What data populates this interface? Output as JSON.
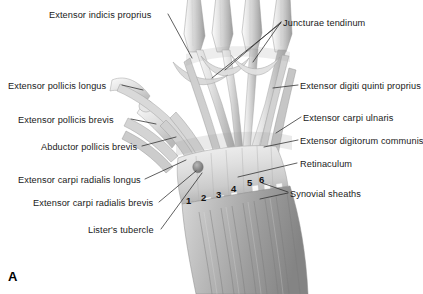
{
  "figure": {
    "panel_letter": "A",
    "background_color": "#ffffff",
    "label_color": "#1a1a1a",
    "leader_color": "#2b2b2b"
  },
  "labels": [
    {
      "id": "extensor-indicis-proprius",
      "text": "Extensor indicis proprius",
      "x": 49,
      "y": 11,
      "align": "left"
    },
    {
      "id": "juncturae-tendinum",
      "text": "Juncturae tendinum",
      "x": 283,
      "y": 19,
      "align": "left"
    },
    {
      "id": "extensor-pollicis-longus",
      "text": "Extensor pollicis longus",
      "x": 8,
      "y": 82,
      "align": "left"
    },
    {
      "id": "extensor-digiti-quinti-proprius",
      "text": "Extensor digiti quinti proprius",
      "x": 300,
      "y": 82,
      "align": "left"
    },
    {
      "id": "extensor-pollicis-brevis",
      "text": "Extensor pollicis brevis",
      "x": 18,
      "y": 116,
      "align": "left"
    },
    {
      "id": "extensor-carpi-ulnaris",
      "text": "Extensor carpi ulnaris",
      "x": 303,
      "y": 114,
      "align": "left"
    },
    {
      "id": "extensor-digitorum-communis",
      "text": "Extensor digitorum communis",
      "x": 300,
      "y": 137,
      "align": "left"
    },
    {
      "id": "abductor-pollicis-brevis",
      "text": "Abductor pollicis brevis",
      "x": 41,
      "y": 143,
      "align": "left"
    },
    {
      "id": "retinaculum",
      "text": "Retinaculum",
      "x": 300,
      "y": 160,
      "align": "left"
    },
    {
      "id": "extensor-carpi-radialis-longus",
      "text": "Extensor carpi radialis longus",
      "x": 18,
      "y": 176,
      "align": "left"
    },
    {
      "id": "extensor-carpi-radialis-brevis",
      "text": "Extensor carpi radialis brevis",
      "x": 33,
      "y": 199,
      "align": "left"
    },
    {
      "id": "synovial-sheaths",
      "text": "Synovial sheaths",
      "x": 290,
      "y": 190,
      "align": "left"
    },
    {
      "id": "listers-tubercle",
      "text": "Lister's tubercle",
      "x": 88,
      "y": 226,
      "align": "left"
    }
  ],
  "compartment_numbers": [
    {
      "id": "compartment-1",
      "text": "1",
      "x": 186,
      "y": 196
    },
    {
      "id": "compartment-2",
      "text": "2",
      "x": 201,
      "y": 193
    },
    {
      "id": "compartment-3",
      "text": "3",
      "x": 216,
      "y": 190
    },
    {
      "id": "compartment-4",
      "text": "4",
      "x": 231,
      "y": 184
    },
    {
      "id": "compartment-5",
      "text": "5",
      "x": 247,
      "y": 178
    },
    {
      "id": "compartment-6",
      "text": "6",
      "x": 259,
      "y": 175
    }
  ]
}
